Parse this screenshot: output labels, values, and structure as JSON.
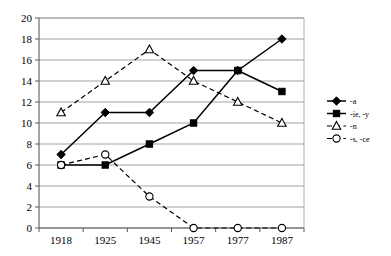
{
  "chart_data": {
    "type": "line",
    "title": "",
    "xlabel": "",
    "ylabel": "",
    "categories": [
      "1918",
      "1925",
      "1945",
      "1957",
      "1977",
      "1987"
    ],
    "ylim": [
      0,
      20
    ],
    "ytick_step": 2,
    "yticks": [
      "0",
      "2",
      "4",
      "6",
      "8",
      "10",
      "12",
      "14",
      "16",
      "18",
      "20"
    ],
    "grid": true,
    "legend_position": "right",
    "series": [
      {
        "name": "-a",
        "marker": "filled-diamond",
        "line": "solid",
        "color": "#000000",
        "values": [
          7,
          11,
          11,
          15,
          15,
          18
        ]
      },
      {
        "name": "-ie, -y",
        "marker": "filled-square",
        "line": "solid",
        "color": "#000000",
        "values": [
          6,
          6,
          8,
          10,
          15,
          13
        ]
      },
      {
        "name": "-n",
        "marker": "open-triangle",
        "line": "dashed",
        "color": "#000000",
        "values": [
          11,
          14,
          17,
          14,
          12,
          10
        ]
      },
      {
        "name": "-s, -ce",
        "marker": "open-circle",
        "line": "dashed",
        "color": "#000000",
        "values": [
          6,
          7,
          3,
          0,
          0,
          0
        ]
      }
    ]
  },
  "legend": {
    "entries": [
      {
        "label": "-a"
      },
      {
        "label": "-ie, -y"
      },
      {
        "label": "-n"
      },
      {
        "label": "-s, -ce"
      }
    ]
  }
}
